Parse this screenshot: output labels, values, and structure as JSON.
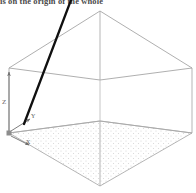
{
  "caption": {
    "text": "is on the origin of the whole"
  },
  "colors": {
    "background": "#ffffff",
    "wireframe": "#9a9a9a",
    "wireframe_light": "#b4b4b4",
    "ray": "#101010",
    "axis": "#6e6e6e",
    "stipple": "#d8d8d8",
    "caption_text": "#4a4a4a",
    "label_text": "#5a5a5a"
  },
  "axes": {
    "z": {
      "label": "Z",
      "direction": "up"
    },
    "y": {
      "label": "Y",
      "direction": "up-right"
    },
    "x": {
      "label": "X",
      "direction": "down-right"
    }
  },
  "geometry": {
    "projection": "isometric",
    "origin": {
      "x": 9,
      "y": 133
    },
    "box": {
      "top_face": [
        {
          "x": 9,
          "y": 68
        },
        {
          "x": 100,
          "y": 11
        },
        {
          "x": 192,
          "y": 68
        },
        {
          "x": 100,
          "y": 80
        }
      ],
      "mid_face": [
        {
          "x": 9,
          "y": 133
        },
        {
          "x": 100,
          "y": 120
        },
        {
          "x": 192,
          "y": 133
        },
        {
          "x": 100,
          "y": 121
        }
      ],
      "bottom_face": [
        {
          "x": 9,
          "y": 133
        },
        {
          "x": 100,
          "y": 121
        },
        {
          "x": 192,
          "y": 133
        },
        {
          "x": 100,
          "y": 186
        }
      ],
      "vertical_edges": [
        {
          "x": 9,
          "y0": 68,
          "y1": 133
        },
        {
          "x": 100,
          "y0": 11,
          "y1": 80
        },
        {
          "x": 192,
          "y0": 68,
          "y1": 133
        },
        {
          "x": 100,
          "y0": 121,
          "y1": 186
        }
      ]
    },
    "ray": {
      "from": {
        "x": 24,
        "y": 124
      },
      "to": {
        "x": 71,
        "y": 0
      },
      "stroke_width": 2.3
    },
    "floor_plane": {
      "fill": "stipple",
      "vertices": [
        {
          "x": 9,
          "y": 133
        },
        {
          "x": 100,
          "y": 121
        },
        {
          "x": 192,
          "y": 133
        },
        {
          "x": 100,
          "y": 186
        }
      ]
    },
    "axis_arrows": [
      {
        "name": "z-axis-arrow",
        "from": {
          "x": 9,
          "y": 133
        },
        "to": {
          "x": 9,
          "y": 70
        }
      },
      {
        "name": "y-axis-arrow",
        "from": {
          "x": 11,
          "y": 131
        },
        "to": {
          "x": 31,
          "y": 118
        }
      },
      {
        "name": "x-axis-arrow",
        "from": {
          "x": 11,
          "y": 136
        },
        "to": {
          "x": 30,
          "y": 146
        }
      }
    ]
  }
}
